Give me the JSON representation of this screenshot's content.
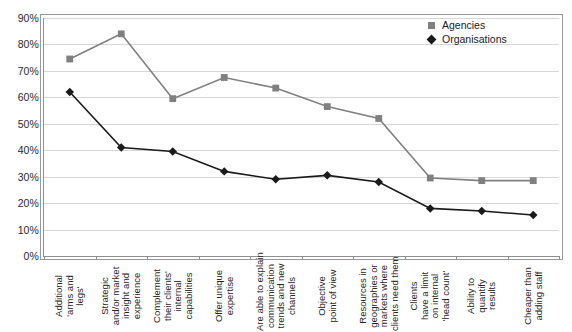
{
  "chart_data": {
    "type": "line",
    "title": "",
    "subtitle": "",
    "xlabel": "",
    "ylabel": "",
    "ylim": [
      0,
      90
    ],
    "ytick_labels": [
      "90%",
      "80%",
      "70%",
      "60%",
      "50%",
      "40%",
      "30%",
      "20%",
      "10%",
      "0%"
    ],
    "ytick_values": [
      90,
      80,
      70,
      60,
      50,
      40,
      30,
      20,
      10,
      0
    ],
    "grid": true,
    "legend_position": "top-right",
    "categories": [
      "Additional 'arms and legs'",
      "Strategic and/or market insight and experience",
      "Complement their clients' internal capabilities",
      "Offer unique expertise",
      "Are able to explain communication trends and new channels",
      "Objective point of view",
      "Resources in geographies or markets where clients need them",
      "Clients have a limit on internal 'head count'",
      "Ability to quantify results",
      "Cheaper than adding staff"
    ],
    "category_lines": [
      [
        "Additional",
        "'arms and",
        "legs'"
      ],
      [
        "Strategic",
        "and/or market",
        "insight and",
        "experience"
      ],
      [
        "Complement",
        "their clients'",
        "internal",
        "capabilities"
      ],
      [
        "Offer unique",
        "expertise"
      ],
      [
        "Are able to explain",
        "communication",
        "trends and new",
        "channels"
      ],
      [
        "Objective",
        "point of view"
      ],
      [
        "Resources in",
        "geographies or",
        "markets where",
        "clients need them"
      ],
      [
        "Clients",
        "have a limit",
        "on internal",
        "'head count'"
      ],
      [
        "Ability to",
        "quantify",
        "results"
      ],
      [
        "Cheaper than",
        "adding staff"
      ]
    ],
    "series": [
      {
        "name": "Agencies",
        "color": "#808080",
        "marker": "square",
        "values": [
          74.5,
          84,
          59.5,
          67.5,
          63.5,
          56.5,
          52,
          29.5,
          28.5,
          28.5
        ]
      },
      {
        "name": "Organisations",
        "color": "#1a1a1a",
        "marker": "diamond",
        "values": [
          62,
          41,
          39.5,
          32,
          29,
          30.5,
          28,
          18,
          17,
          15.5
        ]
      }
    ]
  },
  "legend": {
    "items": [
      {
        "label": "Agencies",
        "marker": "square-marker"
      },
      {
        "label": "Organisations",
        "marker": "diamond-marker"
      }
    ]
  },
  "colors": {
    "agencies": "#808080",
    "organisations": "#1a1a1a",
    "gridline": "#d7d7d7",
    "axis": "#8f8f8f",
    "plot_background": "#ffffff"
  }
}
